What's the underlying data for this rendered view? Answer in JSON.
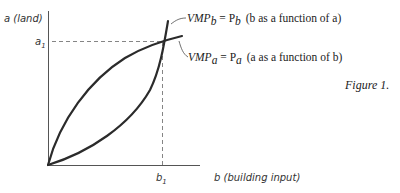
{
  "figure": {
    "caption": "Figure 1.",
    "y_axis_label": "a (land)",
    "x_axis_label": "b (building input)",
    "y_tick": "a",
    "y_tick_sub": "1",
    "x_tick": "b",
    "x_tick_sub": "1",
    "curves": [
      {
        "id": "vmp_b",
        "label_main": "VMP",
        "label_sub": "b",
        "label_eq": " = P",
        "label_eq_sub": "b",
        "label_desc": "(b as a function of a)"
      },
      {
        "id": "vmp_a",
        "label_main": "VMP",
        "label_sub": "a",
        "label_eq": " = P",
        "label_eq_sub": "a",
        "label_desc": "(a as a function of b)"
      }
    ],
    "colors": {
      "curve": "#2b2b2b",
      "axis": "#555555",
      "dashed": "#666666",
      "text": "#222222"
    }
  }
}
